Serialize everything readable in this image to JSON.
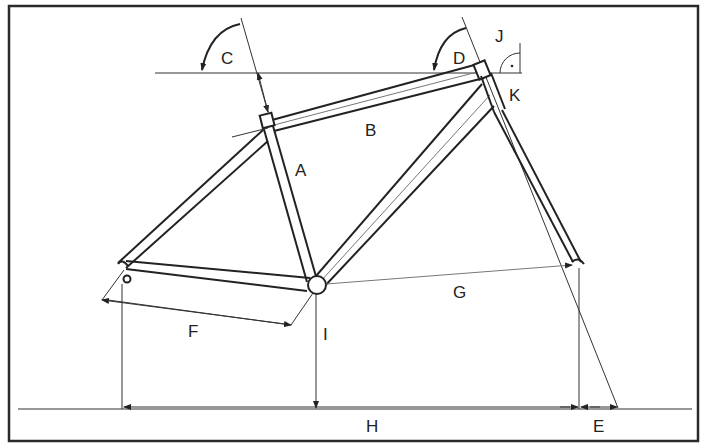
{
  "diagram": {
    "labels": {
      "A": "A",
      "B": "B",
      "C": "C",
      "D": "D",
      "E": "E",
      "F": "F",
      "G": "G",
      "H": "H",
      "I": "I",
      "J": "J",
      "K": "K"
    },
    "colors": {
      "line": "#222222",
      "dimension": "#555555",
      "border": "#2a2a2a",
      "background": "#ffffff"
    }
  }
}
